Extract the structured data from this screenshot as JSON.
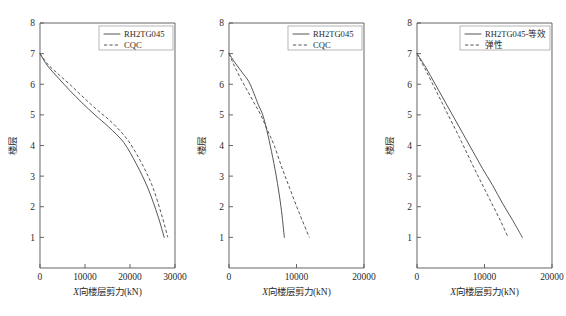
{
  "figure": {
    "background": "#ffffff",
    "line_color": "#4d4d4d",
    "axis_color": "#555555",
    "panel_count": 3
  },
  "chart_data": [
    {
      "type": "line",
      "panel": 1,
      "title": "",
      "xlabel": "X向楼层剪力(kN)",
      "xlabel_italic_prefix": "X",
      "xlabel_rest": "向楼层剪力(kN)",
      "ylabel": "楼层",
      "xlim": [
        0,
        30000
      ],
      "ylim": [
        0,
        8
      ],
      "xticks": [
        0,
        10000,
        20000,
        30000
      ],
      "xticklabels": [
        "0",
        "10000",
        "20000",
        "30000"
      ],
      "yticks": [
        1,
        2,
        3,
        4,
        5,
        6,
        7,
        8
      ],
      "yticklabels": [
        "1",
        "2",
        "3",
        "4",
        "5",
        "6",
        "7",
        "8"
      ],
      "grid": false,
      "legend_position": "top-right",
      "series": [
        {
          "name": "RH2TG045",
          "style": "solid",
          "x": [
            0,
            1700,
            4100,
            6600,
            9300,
            12200,
            15300,
            18600,
            21400,
            24000,
            26200,
            27600
          ],
          "y": [
            7.0,
            6.6,
            6.2,
            5.8,
            5.4,
            5.0,
            4.6,
            4.1,
            3.4,
            2.6,
            1.7,
            1.0
          ]
        },
        {
          "name": "CQC",
          "style": "dashed",
          "x": [
            0,
            1750,
            4300,
            6950,
            9800,
            12800,
            16000,
            19400,
            22300,
            24900,
            27000,
            28400
          ],
          "y": [
            7.0,
            6.65,
            6.3,
            5.95,
            5.55,
            5.15,
            4.75,
            4.2,
            3.5,
            2.7,
            1.75,
            1.0
          ]
        }
      ]
    },
    {
      "type": "line",
      "panel": 2,
      "title": "",
      "xlabel": "X向楼层剪力(kN)",
      "xlabel_italic_prefix": "X",
      "xlabel_rest": "向楼层剪力(kN)",
      "ylabel": "楼层",
      "xlim": [
        0,
        20000
      ],
      "ylim": [
        0,
        8
      ],
      "xticks": [
        0,
        10000,
        20000
      ],
      "xticklabels": [
        "0",
        "10000",
        "20000"
      ],
      "yticks": [
        1,
        2,
        3,
        4,
        5,
        6,
        7,
        8
      ],
      "yticklabels": [
        "1",
        "2",
        "3",
        "4",
        "5",
        "6",
        "7",
        "8"
      ],
      "grid": false,
      "legend_position": "top-right",
      "series": [
        {
          "name": "RH2TG045",
          "style": "solid",
          "x": [
            0,
            900,
            1900,
            2900,
            3700,
            4400,
            5000,
            5600,
            6300,
            7000,
            7700,
            8200
          ],
          "y": [
            7.0,
            6.7,
            6.4,
            6.1,
            5.7,
            5.3,
            5.0,
            4.5,
            3.8,
            3.0,
            2.0,
            1.0
          ]
        },
        {
          "name": "CQC",
          "style": "dashed",
          "x": [
            0,
            800,
            1700,
            2700,
            3700,
            4700,
            5700,
            6700,
            7800,
            9000,
            10400,
            11900
          ],
          "y": [
            7.0,
            6.6,
            6.2,
            5.8,
            5.4,
            5.0,
            4.5,
            4.0,
            3.3,
            2.6,
            1.8,
            1.0
          ]
        }
      ]
    },
    {
      "type": "line",
      "panel": 3,
      "title": "",
      "xlabel": "X向楼层剪力(kN)",
      "xlabel_italic_prefix": "X",
      "xlabel_rest": "向楼层剪力(kN)",
      "ylabel": "楼层",
      "xlim": [
        0,
        20000
      ],
      "ylim": [
        0,
        8
      ],
      "xticks": [
        0,
        10000,
        20000
      ],
      "xticklabels": [
        "0",
        "10000",
        "20000"
      ],
      "yticks": [
        1,
        2,
        3,
        4,
        5,
        6,
        7,
        8
      ],
      "yticklabels": [
        "1",
        "2",
        "3",
        "4",
        "5",
        "6",
        "7",
        "8"
      ],
      "grid": false,
      "legend_position": "top-right",
      "series": [
        {
          "name": "RH2TG045-等效",
          "style": "solid",
          "x": [
            0,
            1300,
            2700,
            4100,
            5500,
            6900,
            8300,
            9700,
            11200,
            12700,
            14200,
            15600
          ],
          "y": [
            7.0,
            6.55,
            6.0,
            5.45,
            4.9,
            4.35,
            3.8,
            3.25,
            2.7,
            2.1,
            1.55,
            1.0
          ]
        },
        {
          "name": "弹性",
          "style": "dashed",
          "x": [
            0,
            1200,
            2450,
            3700,
            4950,
            6200,
            7400,
            8600,
            9850,
            11100,
            12350,
            13500
          ],
          "y": [
            7.0,
            6.5,
            5.95,
            5.4,
            4.85,
            4.3,
            3.75,
            3.2,
            2.65,
            2.1,
            1.55,
            1.0
          ]
        }
      ]
    }
  ]
}
